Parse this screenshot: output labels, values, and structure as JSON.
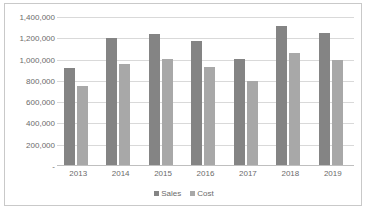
{
  "chart_data": {
    "type": "bar",
    "title": "",
    "xlabel": "",
    "ylabel": "",
    "categories": [
      "2013",
      "2014",
      "2015",
      "2016",
      "2017",
      "2018",
      "2019"
    ],
    "series": [
      {
        "name": "Sales",
        "color": "#848484",
        "values": [
          920000,
          1205000,
          1245000,
          1175000,
          1005000,
          1320000,
          1250000
        ]
      },
      {
        "name": "Cost",
        "color": "#a8a8a8",
        "values": [
          755000,
          960000,
          1010000,
          930000,
          800000,
          1060000,
          995000
        ]
      }
    ],
    "ylim": [
      0,
      1400000
    ],
    "y_ticks": [
      0,
      200000,
      400000,
      600000,
      800000,
      1000000,
      1200000,
      1400000
    ],
    "y_tick_labels": [
      "-",
      "200,000",
      "400,000",
      "600,000",
      "800,000",
      "1,000,000",
      "1,200,000",
      "1,400,000"
    ],
    "grid": true,
    "legend_position": "bottom"
  },
  "legend": {
    "items": [
      {
        "label": "Sales",
        "marker": "legend-swatch-square"
      },
      {
        "label": "Cost",
        "marker": "legend-swatch-square"
      }
    ]
  }
}
